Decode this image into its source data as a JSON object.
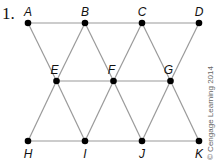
{
  "problem_number": "1.",
  "copyright": "© Cengage Learning 2014",
  "colors": {
    "edge": "#9a9a9a",
    "point": "#000000",
    "label": "#111111"
  },
  "points": [
    {
      "id": "A",
      "label": "A",
      "row": 0,
      "col": 0
    },
    {
      "id": "B",
      "label": "B",
      "row": 0,
      "col": 2
    },
    {
      "id": "C",
      "label": "C",
      "row": 0,
      "col": 4
    },
    {
      "id": "D",
      "label": "D",
      "row": 0,
      "col": 6
    },
    {
      "id": "E",
      "label": "E",
      "row": 1,
      "col": 1
    },
    {
      "id": "F",
      "label": "F",
      "row": 1,
      "col": 3
    },
    {
      "id": "G",
      "label": "G",
      "row": 1,
      "col": 5
    },
    {
      "id": "H",
      "label": "H",
      "row": 2,
      "col": 0
    },
    {
      "id": "I",
      "label": "I",
      "row": 2,
      "col": 2
    },
    {
      "id": "J",
      "label": "J",
      "row": 2,
      "col": 4
    },
    {
      "id": "K",
      "label": "K",
      "row": 2,
      "col": 6
    }
  ],
  "edges": [
    [
      "A",
      "D"
    ],
    [
      "E",
      "G"
    ],
    [
      "H",
      "K"
    ],
    [
      "A",
      "E"
    ],
    [
      "E",
      "B"
    ],
    [
      "B",
      "F"
    ],
    [
      "F",
      "C"
    ],
    [
      "C",
      "G"
    ],
    [
      "G",
      "D"
    ],
    [
      "H",
      "E"
    ],
    [
      "E",
      "I"
    ],
    [
      "I",
      "F"
    ],
    [
      "F",
      "J"
    ],
    [
      "J",
      "G"
    ],
    [
      "G",
      "K"
    ]
  ]
}
